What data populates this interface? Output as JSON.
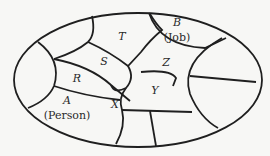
{
  "diagram": {
    "type": "region-map",
    "regions": [
      {
        "id": "T",
        "label": "T",
        "sublabel": ""
      },
      {
        "id": "B",
        "label": "B",
        "sublabel": "(Job)"
      },
      {
        "id": "S",
        "label": "S",
        "sublabel": ""
      },
      {
        "id": "Z",
        "label": "Z",
        "sublabel": ""
      },
      {
        "id": "R",
        "label": "R",
        "sublabel": ""
      },
      {
        "id": "Y",
        "label": "Y",
        "sublabel": ""
      },
      {
        "id": "A",
        "label": "A",
        "sublabel": "(Person)"
      },
      {
        "id": "X",
        "label": "X",
        "sublabel": ""
      }
    ],
    "colors": {
      "line": "#1f1f1f",
      "background": "#f7f7f5",
      "text": "#2a2a2a"
    }
  }
}
